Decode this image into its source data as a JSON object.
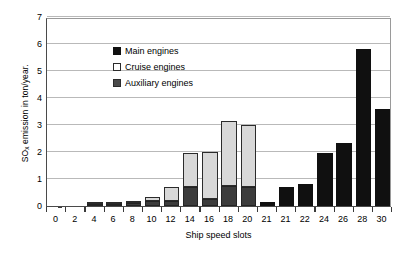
{
  "chart_data": {
    "type": "bar",
    "subtype": "stacked",
    "title": "",
    "xlabel": "Ship speed slots",
    "ylabel": "SOx emission in ton/year.",
    "ylabel_base": "SO",
    "ylabel_sub": "x",
    "ylabel_rest": " emission in ton/year.",
    "ylim": [
      0,
      7
    ],
    "yticks": [
      0,
      1,
      2,
      3,
      4,
      5,
      6,
      7
    ],
    "grid": "horizontal",
    "legend_position": "top-left",
    "categories": [
      "0",
      "2",
      "4",
      "6",
      "8",
      "10",
      "12",
      "14",
      "16",
      "18",
      "20",
      "21",
      "21",
      "22",
      "24",
      "26",
      "28",
      "30"
    ],
    "series": [
      {
        "name": "Main engines",
        "color": "#101010",
        "values": [
          0,
          0,
          0,
          0,
          0,
          0,
          0,
          0,
          0,
          0,
          0,
          0.15,
          0.7,
          0.8,
          1.95,
          2.35,
          5.8,
          3.6
        ]
      },
      {
        "name": "Cruise engines",
        "color": "#ffffff",
        "values": [
          0,
          0,
          0.02,
          0.03,
          0.06,
          0.16,
          0.5,
          1.25,
          1.75,
          2.4,
          2.3,
          0,
          0,
          0,
          0,
          0,
          0,
          0
        ]
      },
      {
        "name": "Auxiliary engines",
        "color": "#4a4a4a",
        "values": [
          0,
          0,
          0.05,
          0.06,
          0.1,
          0.18,
          0.2,
          0.7,
          0.25,
          0.75,
          0.7,
          0,
          0,
          0,
          0,
          0,
          0,
          0
        ]
      }
    ],
    "totals": [
      0,
      0,
      0.07,
      0.09,
      0.16,
      0.34,
      0.7,
      1.95,
      2.0,
      3.15,
      3.0,
      0.15,
      0.7,
      0.8,
      1.95,
      2.35,
      5.8,
      3.6
    ]
  },
  "legend": {
    "items": [
      {
        "label": "Main engines",
        "swatch": "main-swatch"
      },
      {
        "label": "Cruise engines",
        "swatch": "cruise-swatch"
      },
      {
        "label": "Auxiliary engines",
        "swatch": "auxiliary-swatch"
      }
    ]
  }
}
